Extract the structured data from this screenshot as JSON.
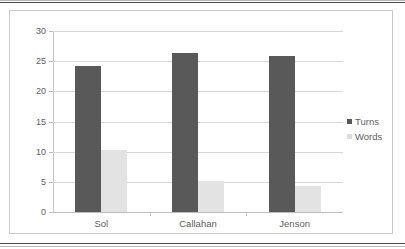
{
  "chart_data": {
    "type": "bar",
    "title": "",
    "subtitle": "",
    "xlabel": "",
    "ylabel": "",
    "categories": [
      "Sol",
      "Callahan",
      "Jenson"
    ],
    "series": [
      {
        "name": "Turns",
        "color": "#595959",
        "values": [
          24.2,
          26.4,
          25.9
        ]
      },
      {
        "name": "Words",
        "color": "#e3e3e3",
        "values": [
          10.3,
          5.2,
          4.3
        ]
      }
    ],
    "ylim": [
      0,
      30
    ],
    "yticks": [
      0,
      5,
      10,
      15,
      20,
      25,
      30
    ],
    "ytick_labels": [
      "0",
      "5",
      "10",
      "15",
      "20",
      "25",
      "30"
    ],
    "grid": true,
    "grid_axis": "y",
    "legend_position": "right",
    "legend_entries": [
      "Turns",
      "Words"
    ],
    "annotations": []
  },
  "colors": {
    "turns": "#595959",
    "words": "#e3e3e3",
    "gridline": "#d6d6d6",
    "axis": "#c4c4c4",
    "text": "#5e5e5e",
    "frame": "#c9c9c9",
    "page_rule": "#4d4d4d"
  }
}
